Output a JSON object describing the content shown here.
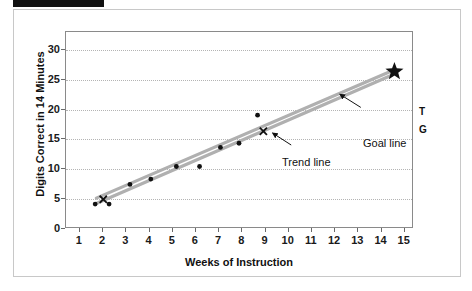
{
  "figure": {
    "redaction_bar": "redacted-label",
    "y_axis": {
      "label": "Digits Correct in 14 Minutes",
      "ticks": [
        "0",
        "5",
        "10",
        "15",
        "20",
        "25",
        "30"
      ]
    },
    "x_axis": {
      "label": "Weeks of Instruction",
      "ticks": [
        "1",
        "2",
        "3",
        "4",
        "5",
        "6",
        "7",
        "8",
        "9",
        "10",
        "11",
        "12",
        "13",
        "14",
        "15"
      ]
    },
    "annotations": {
      "trend_line": "Trend line",
      "goal_line": "Goal line",
      "trend_marker_label": "T",
      "goal_marker_label": "G"
    },
    "colors": {
      "line_gray": "#b0b0b0",
      "point_black": "#111111",
      "grid": "#b4b4b4",
      "frame": "#8a8a8a",
      "card_border": "#c8c8c8",
      "redaction": "#111111"
    }
  },
  "chart_data": {
    "type": "scatter",
    "title": "",
    "xlabel": "Weeks of Instruction",
    "ylabel": "Digits Correct in 14 Minutes",
    "xlim": [
      0.4,
      15.4
    ],
    "ylim": [
      0,
      33
    ],
    "xticks": [
      1,
      2,
      3,
      4,
      5,
      6,
      7,
      8,
      9,
      10,
      11,
      12,
      13,
      14,
      15
    ],
    "yticks": [
      0,
      5,
      10,
      15,
      20,
      25,
      30
    ],
    "grid": "horizontal-dotted",
    "legend": "none",
    "series": [
      {
        "name": "Progress data points",
        "marker": "filled-circle",
        "color": "#111111",
        "points": [
          {
            "x": 1.7,
            "y": 4.0
          },
          {
            "x": 2.3,
            "y": 4.0
          },
          {
            "x": 3.2,
            "y": 7.3
          },
          {
            "x": 4.1,
            "y": 8.2
          },
          {
            "x": 5.2,
            "y": 10.3
          },
          {
            "x": 6.2,
            "y": 10.3
          },
          {
            "x": 7.1,
            "y": 13.5
          },
          {
            "x": 7.9,
            "y": 14.2
          },
          {
            "x": 8.7,
            "y": 18.9
          }
        ]
      },
      {
        "name": "X markers",
        "marker": "x",
        "color": "#111111",
        "points": [
          {
            "x": 2.05,
            "y": 4.8
          },
          {
            "x": 8.95,
            "y": 16.2
          }
        ]
      },
      {
        "name": "Goal line",
        "marker": "line",
        "color": "#b0b0b0",
        "points": [
          {
            "x": 1.75,
            "y": 5.0
          },
          {
            "x": 14.6,
            "y": 26.5
          }
        ]
      },
      {
        "name": "Trend line",
        "marker": "line",
        "color": "#b0b0b0",
        "points": [
          {
            "x": 1.75,
            "y": 4.1
          },
          {
            "x": 14.6,
            "y": 25.8
          }
        ]
      },
      {
        "name": "Goal endpoint",
        "marker": "star",
        "color": "#111111",
        "points": [
          {
            "x": 14.6,
            "y": 26.2
          }
        ]
      }
    ],
    "annotations": [
      {
        "text": "Trend line",
        "x": 10.2,
        "y": 13.0,
        "points_to": {
          "x": 9.35,
          "y": 16.0
        }
      },
      {
        "text": "Goal line",
        "x": 13.2,
        "y": 19.3,
        "points_to": {
          "x": 12.2,
          "y": 22.3
        }
      },
      {
        "text": "T",
        "x": 15.3,
        "y": 28.2
      },
      {
        "text": "G",
        "x": 15.3,
        "y": 25.3
      }
    ]
  }
}
